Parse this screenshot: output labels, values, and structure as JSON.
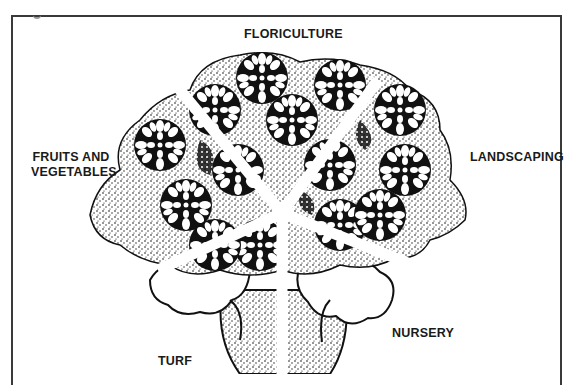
{
  "figure": {
    "title_mark": "g",
    "center": {
      "x": 282,
      "y": 213
    },
    "segments": [
      {
        "id": "floriculture",
        "label": "FLORICULTURE",
        "position": "top"
      },
      {
        "id": "landscaping",
        "label": "LANDSCAPING",
        "position": "right"
      },
      {
        "id": "nursery",
        "label": "NURSERY",
        "position": "bottom-right"
      },
      {
        "id": "turf",
        "label": "TURF",
        "position": "bottom-left"
      },
      {
        "id": "fruits-and-vegetables",
        "label_line1": "FRUITS AND",
        "label_line2": "VEGETABLES",
        "position": "left"
      }
    ],
    "colors": {
      "ink": "#111111",
      "paper": "#ffffff",
      "frame": "#3a3a3a"
    }
  }
}
